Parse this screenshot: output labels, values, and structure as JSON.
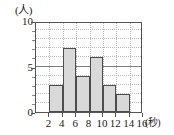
{
  "chart_data": {
    "type": "bar",
    "title": "",
    "subtitle": "",
    "xlabel": "(秒)",
    "ylabel": "(人)",
    "categories": [
      "2-4",
      "4-6",
      "6-8",
      "8-10",
      "10-12",
      "12-14",
      "14-16"
    ],
    "values": [
      3,
      7,
      4,
      6,
      3,
      2,
      0
    ],
    "bin_edges": [
      2,
      4,
      6,
      8,
      10,
      12,
      14,
      16
    ],
    "x_tick_labels": [
      "2",
      "4",
      "6",
      "8",
      "10",
      "12",
      "14",
      "16"
    ],
    "y_tick_labels": [
      "0",
      "5",
      "10"
    ],
    "y_major_ticks": [
      0,
      5,
      10
    ],
    "y_minor_ticks": [
      1,
      2,
      3,
      4,
      6,
      7,
      8,
      9
    ],
    "xlim": [
      0,
      16
    ],
    "ylim": [
      0,
      10
    ],
    "grid": true,
    "legend": null,
    "legend_position": "none",
    "bar_fill_color": "#d9d9d9",
    "bar_edge_color": "#4d4d4d",
    "grid_color": "#b9b9b9",
    "axis_color": "#555555",
    "background_color": "#ffffff"
  },
  "axes": {
    "y_unit_label": "(人)",
    "x_unit_label": "(秒)"
  }
}
